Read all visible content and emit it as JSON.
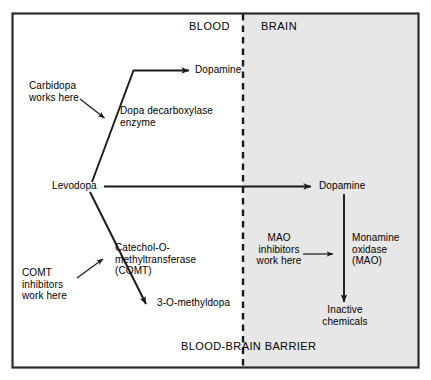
{
  "figure": {
    "type": "flow-diagram",
    "title_text": "BLOOD-BRAIN BARRIER",
    "colors": {
      "border": "#2b2b2b",
      "blood_fill": "#ffffff",
      "brain_fill": "#e7e7e7",
      "line": "#1a1a1a",
      "text": "#000000"
    },
    "regions": {
      "blood_label": "BLOOD",
      "brain_label": "BRAIN"
    },
    "nodes": {
      "levodopa": "Levodopa",
      "dopamine_blood": "Dopamine",
      "dopamine_brain": "Dopamine",
      "methyldopa": "3-O-methyldopa",
      "inactive_chemicals": "Inactive\nchemicals"
    },
    "enzymes": {
      "dopa_decarboxylase": "Dopa decarboxylase\nenzyme",
      "comt": "Catechol-O-\nmethyltransferase\n(COMT)",
      "mao": "Monamine\noxidase\n(MAO)"
    },
    "annotations": {
      "carbidopa": "Carbidopa\nworks here",
      "comt_inhibitors": "COMT\ninhibitors\nwork here",
      "mao_inhibitors": "MAO\ninhibitors\nwork here"
    },
    "arrows": [
      {
        "name": "levodopa-to-dopamine-blood",
        "from": "Levodopa",
        "to": "Dopamine (blood)",
        "via": "Dopa decarboxylase enzyme"
      },
      {
        "name": "levodopa-to-methyldopa",
        "from": "Levodopa",
        "to": "3-O-methyldopa",
        "via": "Catechol-O-methyltransferase (COMT)"
      },
      {
        "name": "levodopa-to-dopamine-brain",
        "from": "Levodopa",
        "to": "Dopamine (brain)",
        "via": "blood-brain barrier"
      },
      {
        "name": "dopamine-brain-to-inactive",
        "from": "Dopamine (brain)",
        "to": "Inactive chemicals",
        "via": "Monamine oxidase (MAO)"
      },
      {
        "name": "carbidopa-pointer",
        "from": "Carbidopa works here",
        "to": "dopa decarboxylase pathway"
      },
      {
        "name": "comt-inhibitors-pointer",
        "from": "COMT inhibitors work here",
        "to": "COMT pathway"
      },
      {
        "name": "mao-inhibitors-pointer",
        "from": "MAO inhibitors work here",
        "to": "MAO pathway"
      }
    ]
  }
}
